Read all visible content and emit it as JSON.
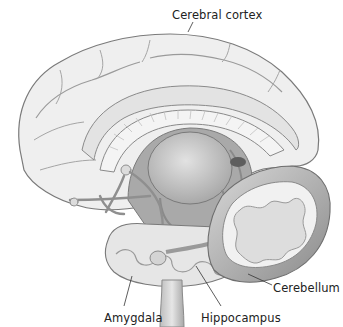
{
  "figure": {
    "type": "anatomical illustration",
    "style": "grayscale pencil drawing, sagittal section of human brain",
    "colors": {
      "background": "#ffffff",
      "outline": "#7a7a7a",
      "fill_light": "#ececec",
      "fill_mid": "#cfcfcf",
      "fill_dark": "#8f8f8f",
      "leader_line": "#333333",
      "label_text": "#222222"
    }
  },
  "labels": {
    "cerebral_cortex": "Cerebral cortex",
    "cerebellum": "Cerebellum",
    "amygdala": "Amygdala",
    "hippocampus": "Hippocampus"
  }
}
